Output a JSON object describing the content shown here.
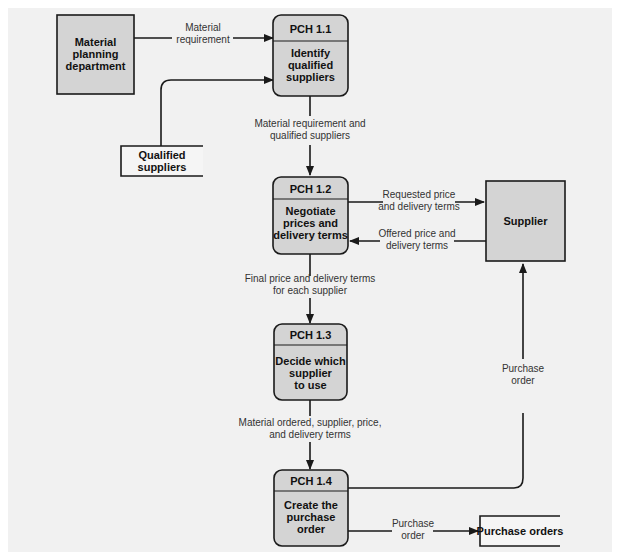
{
  "diagram": {
    "type": "data-flow-diagram",
    "colors": {
      "background": "#f1f1f1",
      "node_fill": "#d4d4d4",
      "stroke": "#1a1a1a",
      "datastore_fill": "#f5f5f5"
    },
    "external_entities": [
      {
        "id": "material-planning",
        "lines": [
          "Material",
          "planning",
          "department"
        ]
      },
      {
        "id": "supplier",
        "lines": [
          "Supplier"
        ]
      }
    ],
    "processes": [
      {
        "id": "pch11",
        "code": "PCH 1.1",
        "lines": [
          "Identify",
          "qualified",
          "suppliers"
        ]
      },
      {
        "id": "pch12",
        "code": "PCH 1.2",
        "lines": [
          "Negotiate",
          "prices and",
          "delivery terms"
        ]
      },
      {
        "id": "pch13",
        "code": "PCH 1.3",
        "lines": [
          "Decide which",
          "supplier",
          "to use"
        ]
      },
      {
        "id": "pch14",
        "code": "PCH 1.4",
        "lines": [
          "Create the",
          "purchase",
          "order"
        ]
      }
    ],
    "data_stores": [
      {
        "id": "qualified-suppliers",
        "lines": [
          "Qualified",
          "suppliers"
        ]
      },
      {
        "id": "purchase-orders",
        "lines": [
          "Purchase orders"
        ]
      }
    ],
    "flows": [
      {
        "from": "material-planning",
        "to": "pch11",
        "lines": [
          "Material",
          "requirement"
        ]
      },
      {
        "from": "qualified-suppliers",
        "to": "pch11",
        "lines": []
      },
      {
        "from": "pch11",
        "to": "pch12",
        "lines": [
          "Material requirement and",
          "qualified suppliers"
        ]
      },
      {
        "from": "pch12",
        "to": "supplier",
        "lines": [
          "Requested price",
          "and delivery terms"
        ]
      },
      {
        "from": "supplier",
        "to": "pch12",
        "lines": [
          "Offered price and",
          "delivery terms"
        ]
      },
      {
        "from": "pch12",
        "to": "pch13",
        "lines": [
          "Final price and delivery terms",
          "for each supplier"
        ]
      },
      {
        "from": "pch13",
        "to": "pch14",
        "lines": [
          "Material ordered, supplier, price,",
          "and delivery terms"
        ]
      },
      {
        "from": "pch14",
        "to": "supplier",
        "lines": [
          "Purchase",
          "order"
        ]
      },
      {
        "from": "pch14",
        "to": "purchase-orders",
        "lines": [
          "Purchase",
          "order"
        ]
      }
    ]
  }
}
